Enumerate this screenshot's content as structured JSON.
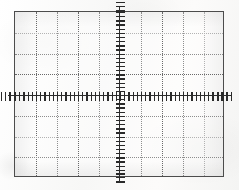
{
  "figure": {
    "kind": "oscilloscope-graticule",
    "title": "",
    "caption": "",
    "background_color": "#fbfbfa",
    "border_color": "#4c4c4c",
    "grid_color": "#8e8e8e",
    "axis_color": "#2d2d2d"
  },
  "chart_data": {
    "type": "scatter",
    "title": "",
    "subtitle": "",
    "xlabel": "",
    "ylabel": "",
    "annotations": [],
    "legend": [],
    "legend_position": "none",
    "grid": true,
    "x": [],
    "y": [],
    "series": [],
    "categories": [],
    "values": [],
    "xlim": [
      -5,
      5
    ],
    "ylim": [
      -4,
      4
    ],
    "xticks": [
      -5,
      -4,
      -3,
      -2,
      -1,
      0,
      1,
      2,
      3,
      4,
      5
    ],
    "yticks": [
      -4,
      -3,
      -2,
      -1,
      0,
      1,
      2,
      3,
      4
    ],
    "xticklabels": [
      "",
      "",
      "",
      "",
      "",
      "",
      "",
      "",
      "",
      "",
      ""
    ],
    "yticklabels": [
      "",
      "",
      "",
      "",
      "",
      "",
      "",
      "",
      ""
    ],
    "divisions_horizontal": 10,
    "divisions_vertical": 8,
    "subdivisions_per_division": 5,
    "axis_tick_count_horizontal": 50,
    "axis_tick_count_vertical": 40
  },
  "grid": {
    "columns": 10,
    "rows": 8,
    "cell_width_px": 21,
    "cell_height_px": 20.75,
    "plate_width_px": 210,
    "plate_height_px": 166,
    "center_x_px": 105,
    "center_y_px": 83,
    "line_style": "dotted",
    "column_lines": [
      {
        "x_px": 21,
        "weight": "strong"
      },
      {
        "x_px": 42,
        "weight": "normal"
      },
      {
        "x_px": 63,
        "weight": "strong"
      },
      {
        "x_px": 84,
        "weight": "normal"
      },
      {
        "x_px": 126,
        "weight": "normal"
      },
      {
        "x_px": 147,
        "weight": "strong"
      },
      {
        "x_px": 168,
        "weight": "normal"
      },
      {
        "x_px": 189,
        "weight": "faint"
      }
    ],
    "row_lines": [
      {
        "y_px": 20.75,
        "weight": "faint"
      },
      {
        "y_px": 41.5,
        "weight": "normal"
      },
      {
        "y_px": 62.25,
        "weight": "strong"
      },
      {
        "y_px": 103.75,
        "weight": "normal"
      },
      {
        "y_px": 124.5,
        "weight": "faint"
      },
      {
        "y_px": 145.25,
        "weight": "normal"
      }
    ]
  }
}
